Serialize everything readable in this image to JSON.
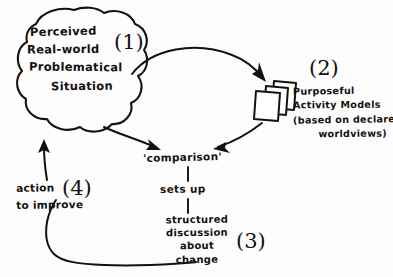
{
  "diagram": {
    "background_color": "#fdfdfd",
    "ink_color": "#14110f",
    "style": "hand-drawn sketch"
  },
  "cloud": {
    "line1": "Perceived",
    "line2": "Real-world",
    "line3": "Problematical",
    "line4": "Situation",
    "number": "(1)"
  },
  "models": {
    "number": "(2)",
    "line1": "Purposeful",
    "line2": "Activity Models",
    "line3": "(based on declared",
    "line4": "worldviews)",
    "icon": "stacked-cards-icon"
  },
  "comparison": {
    "label": "'comparison'",
    "sets_up": "sets up"
  },
  "discussion": {
    "line1": "structured",
    "line2": "discussion",
    "line3": "about",
    "line4": "change",
    "number": "(3)"
  },
  "action": {
    "line1": "action",
    "line2": "to improve",
    "number": "(4)"
  }
}
